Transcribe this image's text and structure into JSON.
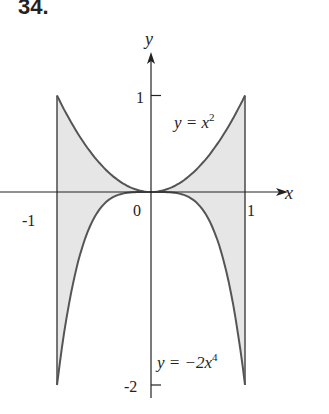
{
  "problem_number": "34.",
  "chart_data": {
    "type": "area",
    "title": "",
    "xlabel": "x",
    "ylabel": "y",
    "xlim": [
      -1,
      1
    ],
    "ylim": [
      -2,
      1
    ],
    "x_ticks": [
      "-1",
      "0",
      "1"
    ],
    "y_ticks": [
      "1",
      "-2"
    ],
    "series": [
      {
        "name": "y = x^2",
        "label": "y = x",
        "exp": "2",
        "x": [
          -1,
          -0.5,
          0,
          0.5,
          1
        ],
        "values": [
          1,
          0.25,
          0,
          0.25,
          1
        ]
      },
      {
        "name": "y = -2x^4",
        "label": "y = −2x",
        "exp": "4",
        "x": [
          -1,
          -0.5,
          0,
          0.5,
          1
        ],
        "values": [
          -2,
          -0.125,
          0,
          -0.125,
          -2
        ]
      }
    ],
    "shaded_region": "between y = x^2 and y = -2x^4 for -1 <= x <= 1",
    "grid": false
  },
  "colors": {
    "fill": "#e6e6e6",
    "curve": "#555555",
    "axis": "#222222"
  }
}
